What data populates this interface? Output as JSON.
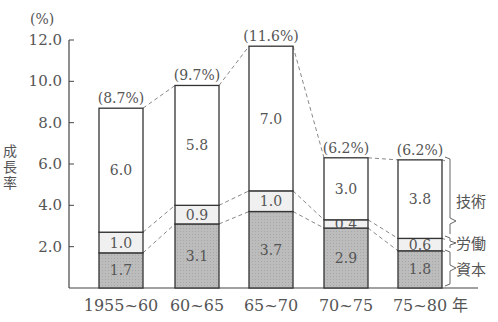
{
  "chart_data": {
    "type": "bar",
    "stacked": true,
    "title": "",
    "ylabel": "成長率",
    "y_unit": "(%)",
    "xlabel_suffix": "年",
    "ylim": [
      0,
      12.0
    ],
    "yticks": [
      "2.0",
      "4.0",
      "6.0",
      "8.0",
      "10.0",
      "12.0"
    ],
    "grid": false,
    "categories": [
      "1955~60",
      "60~65",
      "65~70",
      "70~75",
      "75~80"
    ],
    "totals": [
      8.7,
      9.7,
      11.6,
      6.2,
      6.2
    ],
    "total_labels": [
      "(8.7%)",
      "(9.7%)",
      "(11.6%)",
      "(6.2%)",
      "(6.2%)"
    ],
    "series": [
      {
        "name": "資本",
        "values": [
          1.7,
          3.1,
          3.7,
          2.9,
          1.8
        ],
        "fill": "#bdbdbd"
      },
      {
        "name": "労働",
        "values": [
          1.0,
          0.9,
          1.0,
          0.4,
          0.6
        ],
        "fill": "#f0f0f0"
      },
      {
        "name": "技術",
        "values": [
          6.0,
          5.8,
          7.0,
          3.0,
          3.8
        ],
        "fill": "#ffffff"
      }
    ],
    "legend_position": "right (brace labels)",
    "connectors": "dashed lines linking segment boundaries between adjacent bars"
  },
  "axis": {
    "unit_label": "(%)",
    "y_title_chars": [
      "成",
      "長",
      "率"
    ],
    "x_suffix": "年"
  },
  "legend": {
    "tech": "技術",
    "labor": "労働",
    "capital": "資本"
  }
}
